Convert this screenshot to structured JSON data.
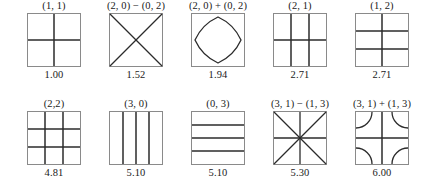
{
  "figure": {
    "panel_size": 54,
    "stroke_color": "#2b2b2b",
    "border_color": "#8a8a8a",
    "rows": [
      {
        "cells": [
          {
            "mode_label": "(1, 1)",
            "frequency": "1.00",
            "pattern": "cross",
            "vertical_fractions": [
              0.5
            ],
            "horizontal_fractions": [
              0.5
            ],
            "diagonals": [],
            "corner_arcs": false,
            "closed_curve": false
          },
          {
            "mode_label": "(2, 0) − (0, 2)",
            "frequency": "1.52",
            "pattern": "x-diagonals",
            "vertical_fractions": [],
            "horizontal_fractions": [],
            "diagonals": [
              "main",
              "anti"
            ],
            "corner_arcs": false,
            "closed_curve": false
          },
          {
            "mode_label": "(2, 0) + (0, 2)",
            "frequency": "1.94",
            "pattern": "rounded-diamond",
            "vertical_fractions": [],
            "horizontal_fractions": [],
            "diagonals": [],
            "corner_arcs": false,
            "closed_curve": true
          },
          {
            "mode_label": "(2, 1)",
            "frequency": "2.71",
            "pattern": "grid",
            "vertical_fractions": [
              0.3333,
              0.6667
            ],
            "horizontal_fractions": [
              0.5
            ],
            "diagonals": [],
            "corner_arcs": false,
            "closed_curve": false
          },
          {
            "mode_label": "(1, 2)",
            "frequency": "2.71",
            "pattern": "grid",
            "vertical_fractions": [
              0.5
            ],
            "horizontal_fractions": [
              0.3333,
              0.6667
            ],
            "diagonals": [],
            "corner_arcs": false,
            "closed_curve": false
          }
        ]
      },
      {
        "cells": [
          {
            "mode_label": "(2,2)",
            "frequency": "4.81",
            "pattern": "grid",
            "vertical_fractions": [
              0.3333,
              0.6667
            ],
            "horizontal_fractions": [
              0.3333,
              0.6667
            ],
            "diagonals": [],
            "corner_arcs": false,
            "closed_curve": false
          },
          {
            "mode_label": "(3, 0)",
            "frequency": "5.10",
            "pattern": "vertical-lines",
            "vertical_fractions": [
              0.25,
              0.5,
              0.75
            ],
            "horizontal_fractions": [],
            "diagonals": [],
            "corner_arcs": false,
            "closed_curve": false
          },
          {
            "mode_label": "(0, 3)",
            "frequency": "5.10",
            "pattern": "horizontal-lines",
            "vertical_fractions": [],
            "horizontal_fractions": [
              0.25,
              0.5,
              0.75
            ],
            "diagonals": [],
            "corner_arcs": false,
            "closed_curve": false
          },
          {
            "mode_label": "(3, 1) − (1, 3)",
            "frequency": "5.30",
            "pattern": "eight-spoke-star",
            "vertical_fractions": [
              0.5
            ],
            "horizontal_fractions": [
              0.5
            ],
            "diagonals": [
              "main",
              "anti"
            ],
            "corner_arcs": false,
            "closed_curve": false
          },
          {
            "mode_label": "(3, 1) + (1, 3)",
            "frequency": "6.00",
            "pattern": "cross-with-corner-arcs",
            "vertical_fractions": [
              0.5
            ],
            "horizontal_fractions": [
              0.5
            ],
            "diagonals": [],
            "corner_arcs": true,
            "closed_curve": false
          }
        ]
      }
    ]
  }
}
